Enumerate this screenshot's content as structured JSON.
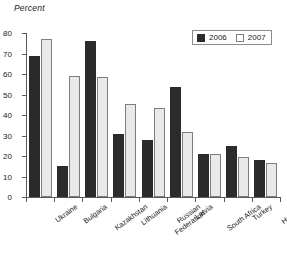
{
  "chart_data": {
    "type": "bar",
    "title": "",
    "subtitle": "",
    "xlabel": "",
    "ylabel": "Percent",
    "ylim": [
      0,
      80
    ],
    "yticks": [
      0,
      10,
      20,
      30,
      40,
      50,
      60,
      70,
      80
    ],
    "grid": false,
    "legend_position": "top-right",
    "categories": [
      "Ukraine",
      "Bulgaria",
      "Kazakhstan",
      "Lithuania",
      "Russian Federation",
      "Latvia",
      "South Africa",
      "Turkey",
      "Hungary"
    ],
    "category_lines": [
      [
        "Ukraine"
      ],
      [
        "Bulgaria"
      ],
      [
        "Kazakhstan"
      ],
      [
        "Lithuania"
      ],
      [
        "Russian",
        "Federation"
      ],
      [
        "Latvia"
      ],
      [
        "South Africa"
      ],
      [
        "Turkey"
      ],
      [
        "Hungary"
      ]
    ],
    "series": [
      {
        "name": "2006",
        "color": "#2b2b2b",
        "values": [
          69,
          15,
          76,
          30.5,
          28,
          53.5,
          21,
          25,
          18
        ]
      },
      {
        "name": "2007",
        "color": "#e9e9e9",
        "values": [
          77,
          59,
          58.5,
          45.5,
          43.5,
          31.5,
          21,
          19.5,
          16.5
        ]
      }
    ]
  },
  "legend": {
    "entries": [
      {
        "label": "2006"
      },
      {
        "label": "2007"
      }
    ]
  },
  "colors": {
    "series_2006": "#2b2b2b",
    "series_2007": "#e9e9e9",
    "axis": "#5a5a5a",
    "text": "#1a1a1a",
    "background": "#ffffff"
  }
}
